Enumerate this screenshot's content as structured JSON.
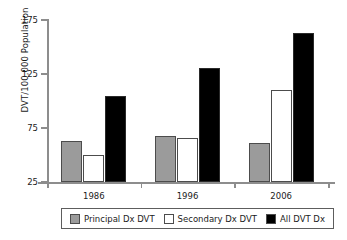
{
  "chart_data": {
    "type": "bar",
    "title": "",
    "xlabel": "",
    "ylabel": "DVT/100,000 Population",
    "categories": [
      "1986",
      "1996",
      "2006"
    ],
    "yticks": [
      25,
      75,
      125,
      175
    ],
    "ylim": [
      25,
      175
    ],
    "grid": false,
    "legend_position": "bottom",
    "series": [
      {
        "name": "Principal Dx DVT",
        "color": "#9b9b9b",
        "values": [
          63,
          68,
          61
        ]
      },
      {
        "name": "Secondary Dx DVT",
        "color": "#ffffff",
        "values": [
          50,
          66,
          110
        ]
      },
      {
        "name": "All DVT Dx",
        "color": "#000000",
        "values": [
          105,
          131,
          163
        ]
      }
    ]
  },
  "axis": {
    "y_title": "DVT/100,000 Population",
    "y_tick_labels": [
      "175",
      "125",
      "75",
      "25"
    ],
    "x_tick_labels": [
      "1986",
      "1996",
      "2006"
    ]
  },
  "legend": {
    "items": [
      {
        "label": "Principal Dx DVT",
        "swatch": "#9b9b9b"
      },
      {
        "label": "Secondary Dx DVT",
        "swatch": "#ffffff"
      },
      {
        "label": "All DVT Dx",
        "swatch": "#000000"
      }
    ]
  }
}
